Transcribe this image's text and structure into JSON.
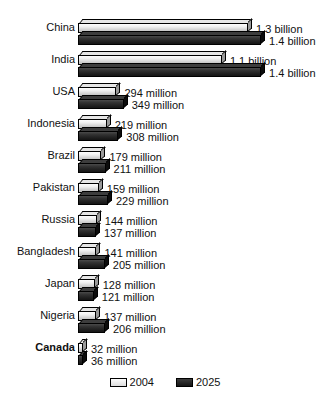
{
  "chart_data": {
    "type": "bar",
    "orientation": "horizontal",
    "title": "",
    "subtitle": "",
    "xlabel": "",
    "ylabel": "",
    "grid": false,
    "legend_position": "bottom-center",
    "xlim": [
      0,
      1400
    ],
    "units": "millions of people",
    "categories": [
      "China",
      "India",
      "USA",
      "Indonesia",
      "Brazil",
      "Pakistan",
      "Russia",
      "Bangladesh",
      "Japan",
      "Nigeria",
      "Canada"
    ],
    "highlighted_category": "Canada",
    "series": [
      {
        "name": "2004",
        "color": "#dcdcdc",
        "values": [
          1300,
          1100,
          294,
          219,
          179,
          159,
          144,
          141,
          128,
          137,
          32
        ],
        "labels": [
          "1.3 billion",
          "1.1 billion",
          "294 million",
          "219 million",
          "179 million",
          "159 million",
          "144 million",
          "141 million",
          "128 million",
          "137 million",
          "32 million"
        ]
      },
      {
        "name": "2025",
        "color": "#1e1e1e",
        "values": [
          1400,
          1400,
          349,
          308,
          211,
          229,
          137,
          205,
          121,
          206,
          36
        ],
        "labels": [
          "1.4 billion",
          "1.4 billion",
          "349 million",
          "308 million",
          "211 million",
          "229 million",
          "137 million",
          "205 million",
          "121 million",
          "206 million",
          "36 million"
        ]
      }
    ]
  },
  "legend": {
    "items": [
      {
        "label": "2004",
        "color": "#dcdcdc"
      },
      {
        "label": "2025",
        "color": "#1e1e1e"
      }
    ]
  }
}
